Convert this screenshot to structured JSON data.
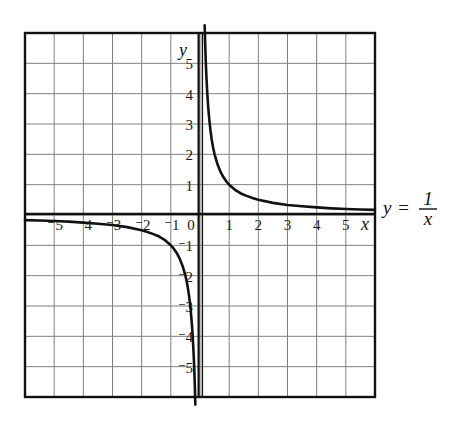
{
  "figure": {
    "background_color": "#ffffff",
    "ink_color": "#111111",
    "grid_color": "#808080",
    "axis_color": "#111111",
    "curve_color": "#111111"
  },
  "equation": {
    "lhs": "y",
    "operator": "=",
    "numerator": "1",
    "denominator": "x"
  },
  "axis_labels": {
    "x_var": "x",
    "y_var": "y",
    "origin": "0",
    "x_positive": [
      "1",
      "2",
      "3",
      "4",
      "5"
    ],
    "x_negative": [
      "⁻5",
      "⁻4",
      "⁻3",
      "⁻2",
      "⁻1"
    ],
    "y_positive": [
      "1",
      "2",
      "3",
      "4",
      "5"
    ],
    "y_negative": [
      "⁻1",
      "⁻2",
      "⁻3",
      "⁻4",
      "⁻5"
    ]
  },
  "chart_data": {
    "type": "line",
    "title": "",
    "subtitle": "",
    "xlabel": "x",
    "ylabel": "y",
    "annotations": [
      "y = 1/x"
    ],
    "legend": [],
    "legend_position": "right",
    "grid": true,
    "xlim": [
      -6,
      6
    ],
    "ylim": [
      -6,
      6
    ],
    "xticks": [
      -5,
      -4,
      -3,
      -2,
      -1,
      0,
      1,
      2,
      3,
      4,
      5
    ],
    "yticks": [
      -5,
      -4,
      -3,
      -2,
      -1,
      1,
      2,
      3,
      4,
      5
    ],
    "xtick_labels": [
      "⁻5",
      "⁻4",
      "⁻3",
      "⁻2",
      "⁻1",
      "0",
      "1",
      "2",
      "3",
      "4",
      "5"
    ],
    "ytick_labels": [
      "⁻5",
      "⁻4",
      "⁻3",
      "⁻2",
      "⁻1",
      "1",
      "2",
      "3",
      "4",
      "5"
    ],
    "series": [
      {
        "name": "y = 1/x (branch x > 0)",
        "x": [
          0.16,
          0.18,
          0.2,
          0.22,
          0.25,
          0.28,
          0.32,
          0.36,
          0.4,
          0.45,
          0.5,
          0.6,
          0.7,
          0.8,
          0.9,
          1.0,
          1.2,
          1.4,
          1.6,
          1.8,
          2.0,
          2.5,
          3.0,
          3.5,
          4.0,
          4.5,
          5.0,
          5.5,
          6.0
        ],
        "y": [
          6.25,
          5.56,
          5.0,
          4.55,
          4.0,
          3.57,
          3.13,
          2.78,
          2.5,
          2.22,
          2.0,
          1.67,
          1.43,
          1.25,
          1.11,
          1.0,
          0.83,
          0.71,
          0.63,
          0.56,
          0.5,
          0.4,
          0.33,
          0.29,
          0.25,
          0.22,
          0.2,
          0.18,
          0.17
        ]
      },
      {
        "name": "y = 1/x (branch x < 0)",
        "x": [
          -6.0,
          -5.5,
          -5.0,
          -4.5,
          -4.0,
          -3.5,
          -3.0,
          -2.5,
          -2.0,
          -1.8,
          -1.6,
          -1.4,
          -1.2,
          -1.0,
          -0.9,
          -0.8,
          -0.7,
          -0.6,
          -0.5,
          -0.45,
          -0.4,
          -0.36,
          -0.32,
          -0.28,
          -0.25,
          -0.22,
          -0.2,
          -0.18,
          -0.16
        ],
        "y": [
          -0.17,
          -0.18,
          -0.2,
          -0.22,
          -0.25,
          -0.29,
          -0.33,
          -0.4,
          -0.5,
          -0.56,
          -0.63,
          -0.71,
          -0.83,
          -1.0,
          -1.11,
          -1.25,
          -1.43,
          -1.67,
          -2.0,
          -2.22,
          -2.5,
          -2.78,
          -3.13,
          -3.57,
          -4.0,
          -4.55,
          -5.0,
          -5.56,
          -6.25
        ]
      }
    ]
  }
}
